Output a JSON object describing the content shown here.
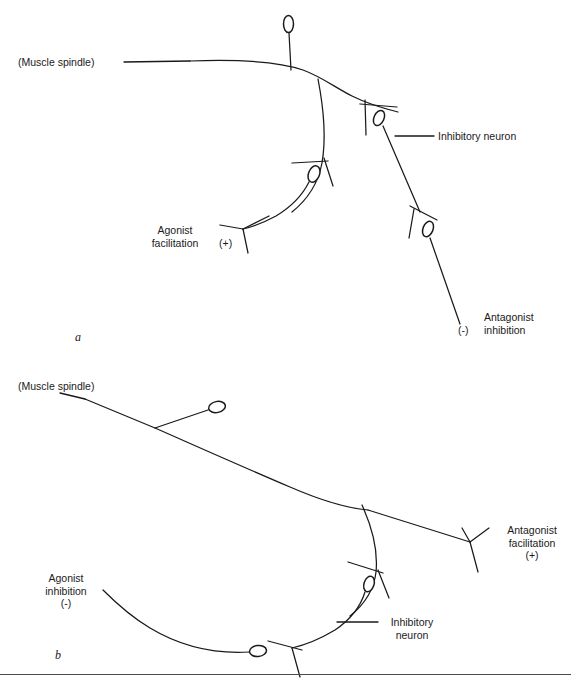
{
  "figure": {
    "type": "neuroanatomy-schematic",
    "title_visible": false,
    "background_color": "#ffffff",
    "ink_color": "#1a1a1a",
    "panel_count": 2
  },
  "panel_a": {
    "letter": "a",
    "labels": {
      "muscle_spindle": "(Muscle spindle)",
      "inhibitory_neuron": "Inhibitory neuron",
      "agonist_line1": "Agonist",
      "agonist_line2": "facilitation",
      "agonist_sign": "(+)",
      "antagonist_line1": "Antagonist",
      "antagonist_line2": "inhibition",
      "antagonist_sign": "(-)"
    }
  },
  "panel_b": {
    "letter": "b",
    "labels": {
      "muscle_spindle": "(Muscle spindle)",
      "inhibitory_line1": "Inhibitory",
      "inhibitory_line2": "neuron",
      "agonist_line1": "Agonist",
      "agonist_line2": "inhibition",
      "agonist_sign": "(-)",
      "antagonist_line1": "Antagonist",
      "antagonist_line2": "facilitation",
      "antagonist_sign": "(+)"
    }
  },
  "caption": {
    "text": ""
  }
}
